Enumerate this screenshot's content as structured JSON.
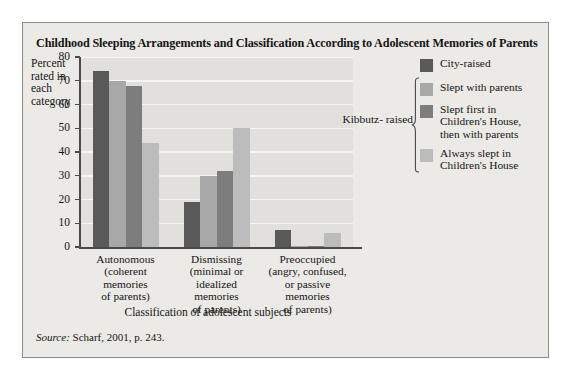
{
  "figure": {
    "title": "Childhood Sleeping Arrangements and Classification According to Adolescent Memories of Parents",
    "source_label": "Source:",
    "source_text": " Scharf, 2001, p. 243."
  },
  "legend": {
    "brace_label": "Kibbutz-\nraised",
    "items": [
      {
        "label": "City-raised",
        "color": "#595959"
      },
      {
        "label": "Slept with parents",
        "color": "#a8a8a8"
      },
      {
        "label": "Slept first in\nChildren's House,\nthen with parents",
        "color": "#7d7d7d"
      },
      {
        "label": "Always slept in\nChildren's House",
        "color": "#bcbcbc"
      }
    ]
  },
  "chart_data": {
    "type": "bar",
    "title": "Childhood Sleeping Arrangements and Classification According to Adolescent Memories of Parents",
    "xlabel": "Classification of adolescent subjects",
    "ylabel": "Percent rated in each category",
    "ylim": [
      0,
      80
    ],
    "yticks": [
      0,
      10,
      20,
      30,
      40,
      50,
      60,
      70,
      80
    ],
    "ytick_labels": [
      "0",
      "10",
      "20",
      "30",
      "40",
      "50",
      "60",
      "70",
      "80"
    ],
    "grid": "horizontal",
    "legend_position": "right",
    "categories": [
      "Autonomous\n(coherent\nmemories\nof parents)",
      "Dismissing\n(minimal or\nidealized\nmemories\nof parents)",
      "Preoccupied\n(angry, confused,\nor passive\nmemories\nof parents)"
    ],
    "series": [
      {
        "name": "City-raised",
        "color": "#595959",
        "values": [
          74,
          19,
          7
        ]
      },
      {
        "name": "Slept with parents",
        "color": "#a8a8a8",
        "values": [
          70,
          30,
          0.5
        ]
      },
      {
        "name": "Slept first in Children's House, then with parents",
        "color": "#7d7d7d",
        "values": [
          68,
          32,
          0.5
        ]
      },
      {
        "name": "Always slept in Children's House",
        "color": "#bcbcbc",
        "values": [
          44,
          50,
          6
        ]
      }
    ]
  }
}
